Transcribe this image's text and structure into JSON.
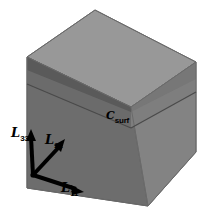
{
  "figure": {
    "type": "3d-cube-diagram",
    "width": 212,
    "height": 224,
    "background_color": "#ffffff"
  },
  "cube": {
    "name": "representative-volume-cube",
    "top_face_color": "#9a9a9a",
    "left_face_color": "#6e6e6e",
    "right_face_color": "#828282",
    "interior_band_color": "#5d5d5d",
    "interior_floor_color": "#8e8e8e",
    "edge_color": "#6a6a6a",
    "vertices": {
      "top_apex": [
        95,
        10
      ],
      "top_left": [
        27,
        57
      ],
      "top_right": [
        196,
        62
      ],
      "top_back": [
        131,
        107
      ],
      "bottom_left": [
        27,
        188
      ],
      "bottom_front": [
        148,
        206
      ],
      "bottom_right": [
        196,
        152
      ]
    }
  },
  "axes": {
    "name": "coordinate-triad",
    "origin": [
      33,
      175
    ],
    "color": "#000000",
    "items": [
      {
        "id": "l33",
        "symbol": "L",
        "subscript": "33",
        "label": "ℒ3₃",
        "direction": "up",
        "tip": [
          31,
          133
        ]
      },
      {
        "id": "l22",
        "symbol": "L",
        "subscript": "22",
        "label": "ℒ2₂",
        "direction": "up-right",
        "tip": [
          63,
          142
        ]
      },
      {
        "id": "l11",
        "symbol": "L",
        "subscript": "11",
        "label": "ℒ1₁",
        "direction": "down-right",
        "tip": [
          79,
          192
        ]
      }
    ]
  },
  "annotations": {
    "surface": {
      "symbol": "C",
      "subscript": "surf",
      "label": "C_surf",
      "position": [
        106,
        106
      ]
    }
  }
}
